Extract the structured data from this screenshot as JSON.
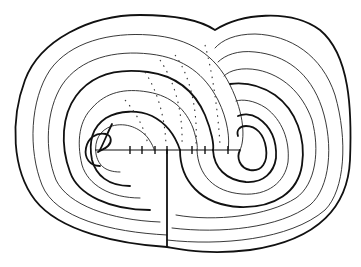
{
  "figure": {
    "type": "line-drawing",
    "colors": {
      "background": "#ffffff",
      "ink": "#111111"
    },
    "left_spiral_center": [
      95,
      152
    ],
    "right_spiral_center": [
      285,
      152
    ],
    "chord": {
      "x1": 95,
      "x2": 240,
      "y": 150
    },
    "vertical_line": {
      "x": 167,
      "y1": 150,
      "y2": 247
    },
    "left_lobe_contours": 7,
    "right_lobe_contours": 7
  }
}
